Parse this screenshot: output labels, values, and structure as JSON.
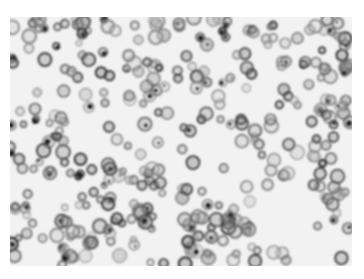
{
  "image": {
    "description": "Grayscale micrograph of densely packed rounded cells with dark membranes on a light background",
    "background_color": "#ffffff",
    "field_color": "#f2f2f2",
    "cell_color": "#3a3a3a",
    "region": {
      "x": 10,
      "y": 17,
      "width": 342,
      "height": 249
    },
    "cell_count_approx": 420,
    "seed": 7
  }
}
